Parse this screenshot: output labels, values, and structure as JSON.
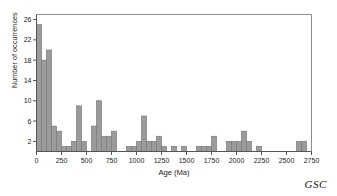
{
  "chart_data": {
    "type": "bar",
    "title": "",
    "xlabel": "Age (Ma)",
    "ylabel": "Number of occurrences",
    "xlim": [
      0,
      2750
    ],
    "ylim": [
      0,
      27
    ],
    "grid": false,
    "legend": null,
    "bin_width": 50,
    "xticks": [
      0,
      250,
      500,
      750,
      1000,
      1250,
      1500,
      1750,
      2000,
      2250,
      2500,
      2750
    ],
    "xtick_labels": [
      "0",
      "250",
      "500",
      "750",
      "1000",
      "1250",
      "1500",
      "1750",
      "2000",
      "2250",
      "2500",
      "2750"
    ],
    "yticks": [
      2,
      6,
      10,
      14,
      18,
      22,
      26
    ],
    "ytick_labels": [
      "2",
      "6",
      "10",
      "14",
      "18",
      "22",
      "26"
    ],
    "bar_fill": "#9b9b9b",
    "bar_stroke": "#7a7a7a",
    "axis_color": "#6e6e6e",
    "bin_starts": [
      0,
      50,
      100,
      150,
      200,
      250,
      300,
      350,
      400,
      450,
      500,
      550,
      600,
      650,
      700,
      750,
      800,
      850,
      900,
      950,
      1000,
      1050,
      1100,
      1150,
      1200,
      1250,
      1300,
      1350,
      1400,
      1450,
      1500,
      1550,
      1600,
      1650,
      1700,
      1750,
      1800,
      1850,
      1900,
      1950,
      2000,
      2050,
      2100,
      2150,
      2200,
      2250,
      2300,
      2350,
      2400,
      2450,
      2500,
      2550,
      2600,
      2650,
      2700
    ],
    "values": [
      25,
      18,
      20,
      5,
      4,
      1,
      1,
      2,
      9,
      2,
      0,
      5,
      10,
      3,
      3,
      4,
      0,
      0,
      1,
      1,
      2,
      7,
      2,
      2,
      3,
      1,
      0,
      1,
      0,
      1,
      0,
      0,
      1,
      1,
      1,
      3,
      0,
      0,
      2,
      2,
      2,
      4,
      2,
      0,
      1,
      0,
      0,
      0,
      0,
      0,
      0,
      0,
      2,
      2,
      0
    ]
  },
  "annotation": {
    "credit": "GSC"
  }
}
